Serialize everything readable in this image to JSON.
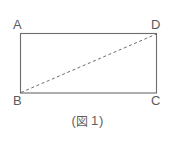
{
  "figure": {
    "caption": {
      "open_paren": "(",
      "figure_word": "図",
      "number": "1",
      "close_paren": ")",
      "full_text": "(図 1)"
    },
    "shape": {
      "type": "rectangle",
      "name": "rectangle-ABCD",
      "vertices": [
        {
          "label": "A",
          "position": "top-left",
          "x": 20,
          "y": 33
        },
        {
          "label": "D",
          "position": "top-right",
          "x": 157,
          "y": 33
        },
        {
          "label": "C",
          "position": "bottom-right",
          "x": 157,
          "y": 93
        },
        {
          "label": "B",
          "position": "bottom-left",
          "x": 20,
          "y": 93
        }
      ],
      "edges": [
        {
          "name": "edge-AD",
          "from": "A",
          "to": "D",
          "style": "solid"
        },
        {
          "name": "edge-DC",
          "from": "D",
          "to": "C",
          "style": "solid"
        },
        {
          "name": "edge-CB",
          "from": "C",
          "to": "B",
          "style": "solid"
        },
        {
          "name": "edge-BA",
          "from": "B",
          "to": "A",
          "style": "solid"
        }
      ],
      "diagonal": {
        "name": "diagonal-BD",
        "from": "B",
        "to": "D",
        "style": "dashed"
      }
    },
    "colors": {
      "background": "#ffffff",
      "stroke": "#6b6b6b",
      "dashed_stroke": "#6e6e6e",
      "label_text": "#5a5a5a",
      "caption_text": "#5f5f5f"
    }
  }
}
